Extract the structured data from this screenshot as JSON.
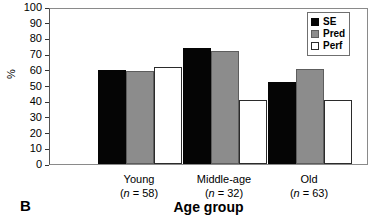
{
  "panel": {
    "letter": "B"
  },
  "chart_data": {
    "type": "bar",
    "title": "",
    "xlabel": "Age group",
    "ylabel": "%",
    "ylim": [
      0,
      100
    ],
    "ytick_step": 10,
    "ytick_labels": [
      "0",
      "10",
      "20",
      "30",
      "40",
      "50",
      "60",
      "70",
      "80",
      "90",
      "100"
    ],
    "grid": false,
    "legend_position": "top-right",
    "categories": [
      "Young",
      "Middle-age",
      "Old"
    ],
    "category_counts": [
      "(n = 58)",
      "(n = 32)",
      "(n = 63)"
    ],
    "category_n_prefix": "(",
    "category_n_label": "n",
    "category_n_values": [
      "58",
      "32",
      "63"
    ],
    "series": [
      {
        "name": "SE",
        "color": "#050505",
        "values": [
          60,
          74,
          52.5
        ]
      },
      {
        "name": "Pred",
        "color": "#8c8c8c",
        "values": [
          59.5,
          72,
          60.5
        ]
      },
      {
        "name": "Perf",
        "color": "#ffffff",
        "values": [
          62,
          41,
          41
        ]
      }
    ]
  }
}
